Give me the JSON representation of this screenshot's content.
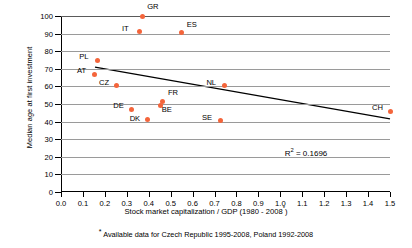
{
  "chart_data": {
    "type": "scatter",
    "title": "",
    "xlabel": "Stock market capitalization / GDP (1980 - 2008*)",
    "ylabel": "Median age at first investment",
    "xlim": [
      0.0,
      1.5
    ],
    "ylim": [
      0,
      100
    ],
    "grid": true,
    "legend": "none",
    "x_ticks": [
      "0.0",
      "0.1",
      "0.2",
      "0.3",
      "0.4",
      "0.5",
      "0.6",
      "0.7",
      "0.8",
      "0.9",
      "1.0",
      "1.1",
      "1.2",
      "1.3",
      "1.4",
      "1.5"
    ],
    "x_tick_values": [
      0.0,
      0.1,
      0.2,
      0.3,
      0.4,
      0.5,
      0.6,
      0.7,
      0.8,
      0.9,
      1.0,
      1.1,
      1.2,
      1.3,
      1.4,
      1.5
    ],
    "y_ticks": [
      "0",
      "10",
      "20",
      "30",
      "40",
      "50",
      "60",
      "70",
      "80",
      "90",
      "100"
    ],
    "y_tick_values": [
      0,
      10,
      20,
      30,
      40,
      50,
      60,
      70,
      80,
      90,
      100
    ],
    "point_color": "#F4653B",
    "points": [
      {
        "label": "GR",
        "x": 0.37,
        "y": 100,
        "label_dx": 5,
        "label_dy": -10
      },
      {
        "label": "IT",
        "x": 0.36,
        "y": 91,
        "label_dx": -18,
        "label_dy": -4
      },
      {
        "label": "ES",
        "x": 0.55,
        "y": 90.5,
        "label_dx": 5,
        "label_dy": -9
      },
      {
        "label": "PL",
        "x": 0.165,
        "y": 75,
        "label_dx": -18,
        "label_dy": -4
      },
      {
        "label": "AT",
        "x": 0.155,
        "y": 67,
        "label_dx": -18,
        "label_dy": -4
      },
      {
        "label": "CZ",
        "x": 0.255,
        "y": 60.5,
        "label_dx": -18,
        "label_dy": -4
      },
      {
        "label": "NL",
        "x": 0.745,
        "y": 60.5,
        "label_dx": -18,
        "label_dy": -4
      },
      {
        "label": "FR",
        "x": 0.465,
        "y": 51.5,
        "label_dx": 5,
        "label_dy": -9
      },
      {
        "label": "BE",
        "x": 0.455,
        "y": 49,
        "label_dx": 1,
        "label_dy": 3
      },
      {
        "label": "DE",
        "x": 0.32,
        "y": 47,
        "label_dx": -18,
        "label_dy": -4
      },
      {
        "label": "CH",
        "x": 1.5,
        "y": 46,
        "label_dx": -18,
        "label_dy": -4
      },
      {
        "label": "DK",
        "x": 0.395,
        "y": 41,
        "label_dx": -18,
        "label_dy": -2
      },
      {
        "label": "SE",
        "x": 0.725,
        "y": 40.5,
        "label_dx": -18,
        "label_dy": -4
      }
    ],
    "trendline": {
      "x0": 0.155,
      "y0": 71.0,
      "x1": 1.5,
      "y1": 41.5,
      "color": "#000000",
      "width": 1.3
    },
    "annotation": {
      "text_prefix": "R",
      "text_sup": "2",
      "text_suffix": " = 0.1696",
      "x": 1.02,
      "y": 22
    }
  },
  "axis": {
    "y_title": "Median age at first investment",
    "x_title_main": "Stock market capitalization / GDP (1980 - 2008",
    "x_title_star": "*",
    "x_title_end": ")"
  },
  "footnote": {
    "star": "*",
    "text": " Available data for Czech Republic 1995-2008, Poland 1992-2008"
  }
}
